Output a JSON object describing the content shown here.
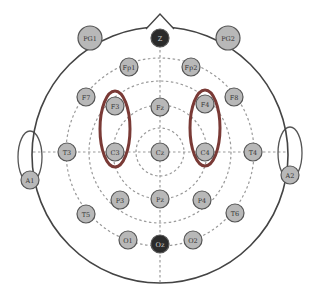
{
  "diagram": {
    "type": "EEG 10-20 electrode placement",
    "colors": {
      "background": "#ffffff",
      "head_outline": "#444444",
      "grid_dashed": "#9a9a9a",
      "electrode_fill": "#b8b8b8",
      "electrode_stroke": "#555555",
      "dark_electrode_fill": "#2b2b2b",
      "highlight_ellipse": "#7a3a36"
    },
    "electrodes": [
      {
        "id": "Z",
        "label": "Z",
        "x": 160,
        "y": 38,
        "dark": true
      },
      {
        "id": "PG1",
        "label": "PG1",
        "x": 90,
        "y": 38,
        "dark": false,
        "r": 12
      },
      {
        "id": "PG2",
        "label": "PG2",
        "x": 228,
        "y": 38,
        "dark": false,
        "r": 12
      },
      {
        "id": "Fp1",
        "label": "Fp1",
        "x": 129,
        "y": 67,
        "dark": false
      },
      {
        "id": "Fp2",
        "label": "Fp2",
        "x": 191,
        "y": 67,
        "dark": false
      },
      {
        "id": "F7",
        "label": "F7",
        "x": 86,
        "y": 97,
        "dark": false
      },
      {
        "id": "F3",
        "label": "F3",
        "x": 115,
        "y": 106,
        "dark": false
      },
      {
        "id": "Fz",
        "label": "Fz",
        "x": 160,
        "y": 107,
        "dark": false
      },
      {
        "id": "F4",
        "label": "F4",
        "x": 205,
        "y": 104,
        "dark": false
      },
      {
        "id": "F8",
        "label": "F8",
        "x": 234,
        "y": 97,
        "dark": false
      },
      {
        "id": "T3",
        "label": "T3",
        "x": 67,
        "y": 152,
        "dark": false
      },
      {
        "id": "C3",
        "label": "C3",
        "x": 115,
        "y": 152,
        "dark": false
      },
      {
        "id": "Cz",
        "label": "Cz",
        "x": 160,
        "y": 152,
        "dark": false
      },
      {
        "id": "C4",
        "label": "C4",
        "x": 205,
        "y": 152,
        "dark": false
      },
      {
        "id": "T4",
        "label": "T4",
        "x": 253,
        "y": 152,
        "dark": false
      },
      {
        "id": "A1",
        "label": "A1",
        "x": 30,
        "y": 180,
        "dark": false
      },
      {
        "id": "A2",
        "label": "A2",
        "x": 290,
        "y": 175,
        "dark": false
      },
      {
        "id": "T5",
        "label": "T5",
        "x": 86,
        "y": 214,
        "dark": false
      },
      {
        "id": "P3",
        "label": "P3",
        "x": 120,
        "y": 200,
        "dark": false
      },
      {
        "id": "Pz",
        "label": "Pz",
        "x": 160,
        "y": 199,
        "dark": false
      },
      {
        "id": "P4",
        "label": "P4",
        "x": 202,
        "y": 200,
        "dark": false
      },
      {
        "id": "T6",
        "label": "T6",
        "x": 235,
        "y": 213,
        "dark": false
      },
      {
        "id": "O1",
        "label": "O1",
        "x": 128,
        "y": 240,
        "dark": false
      },
      {
        "id": "Oz",
        "label": "Oz",
        "x": 160,
        "y": 244,
        "dark": true
      },
      {
        "id": "O2",
        "label": "O2",
        "x": 193,
        "y": 240,
        "dark": false
      }
    ],
    "highlighted_regions": [
      {
        "id": "left-f3-c3",
        "cx": 115,
        "cy": 129,
        "rx": 15,
        "ry": 38
      },
      {
        "id": "right-f4-c4",
        "cx": 205,
        "cy": 128,
        "rx": 15,
        "ry": 38
      }
    ]
  }
}
